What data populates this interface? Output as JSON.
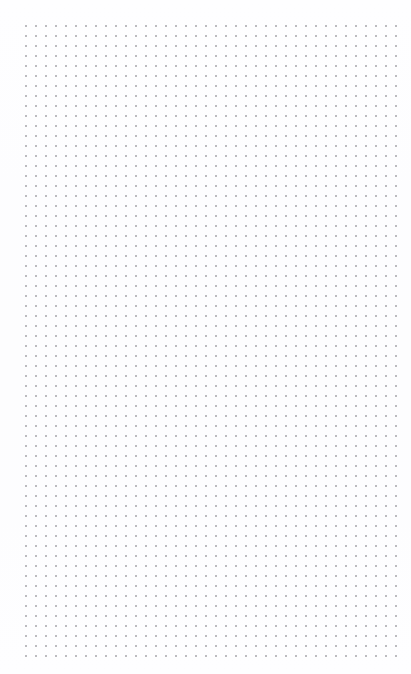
{
  "app": {
    "surface_name": "dot-grid-canvas",
    "title": "",
    "has_visible_chrome": false,
    "has_visible_text": false
  },
  "canvas": {
    "background_color": "#ffffff",
    "paper_color": "#fefeff",
    "dot_color": "#b6b6bb",
    "dot_pitch_px": 10,
    "dot_radius_px": 1,
    "grid_left_px": 22,
    "grid_top_px": 22,
    "grid_right_px": 392,
    "grid_bottom_px": 652,
    "grid_columns": 38,
    "grid_rows": 64,
    "margin_left_px": 22,
    "margin_top_px": 22,
    "margin_right_px": 19,
    "margin_bottom_px": 22,
    "content_items": [],
    "empty_state_label": ""
  },
  "viewport": {
    "width_px": 411,
    "height_px": 674,
    "zoom_percent": 100,
    "scroll_x": 0,
    "scroll_y": 0
  }
}
